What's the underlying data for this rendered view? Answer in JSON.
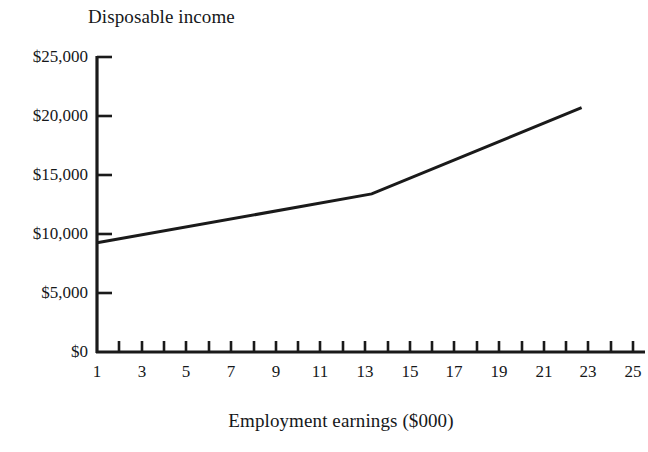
{
  "chart_data": {
    "type": "line",
    "title": "Disposable income",
    "xlabel": "Employment earnings ($000)",
    "ylabel": "",
    "xlim": [
      1,
      25
    ],
    "ylim": [
      0,
      25000
    ],
    "grid": false,
    "legend": null,
    "x_tick_labels": [
      "1",
      "3",
      "5",
      "7",
      "9",
      "11",
      "13",
      "15",
      "17",
      "19",
      "21",
      "23",
      "25"
    ],
    "x_tick_values": [
      1,
      3,
      5,
      7,
      9,
      11,
      13,
      15,
      17,
      19,
      21,
      23,
      25
    ],
    "x_minor_tick_values": [
      2,
      4,
      6,
      8,
      10,
      12,
      14,
      16,
      18,
      20,
      22,
      24
    ],
    "y_tick_labels": [
      "$0",
      "$5,000",
      "$10,000",
      "$15,000",
      "$20,000",
      "$25,000"
    ],
    "y_tick_values": [
      0,
      5000,
      10000,
      15000,
      20000,
      25000
    ],
    "series": [
      {
        "name": "Disposable income",
        "color": "#1a1a1a",
        "x": [
          1,
          13.3,
          22.7
        ],
        "values": [
          9250,
          13400,
          20700
        ]
      }
    ]
  },
  "axis": {
    "line_color": "#1a1a1a",
    "x_axis_label": "Employment earnings ($000)",
    "y_axis_title": "Disposable income"
  }
}
